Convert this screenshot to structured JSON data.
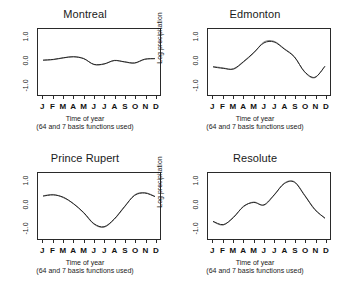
{
  "figure": {
    "axis": {
      "ylabel": "Log precipitation",
      "yticks": [
        "1.0",
        "0.0",
        "-1.0"
      ],
      "xticklabels": [
        "J",
        "F",
        "M",
        "A",
        "M",
        "J",
        "J",
        "A",
        "S",
        "O",
        "N",
        "D"
      ],
      "caption_main": "Time of year",
      "caption_sub": "(64 and 7 basis functions used)"
    },
    "panels": [
      {
        "title": "Montreal"
      },
      {
        "title": "Edmonton"
      },
      {
        "title": "Prince Rupert"
      },
      {
        "title": "Resolute"
      }
    ]
  },
  "chart_data": [
    {
      "type": "line",
      "title": "Montreal",
      "xlabel": "Time of year",
      "xlabel_sub": "(64 and 7 basis functions used)",
      "ylabel": "Log precipitation",
      "x": [
        "J",
        "F",
        "M",
        "A",
        "M",
        "J",
        "J",
        "A",
        "S",
        "O",
        "N",
        "D"
      ],
      "xlim": [
        0.5,
        12.5
      ],
      "ylim": [
        -1.45,
        1.35
      ],
      "yticks": [
        1.0,
        0.0,
        -1.0
      ],
      "grid": false,
      "legend": "none",
      "series": [
        {
          "name": "64 basis functions",
          "values": [
            0.02,
            0.05,
            0.12,
            0.18,
            0.1,
            -0.16,
            -0.14,
            0.02,
            -0.05,
            -0.1,
            0.06,
            0.1
          ]
        },
        {
          "name": "7 basis functions",
          "values": [
            0.03,
            0.06,
            0.13,
            0.17,
            0.09,
            -0.15,
            -0.13,
            0.01,
            -0.04,
            -0.09,
            0.07,
            0.09
          ]
        }
      ]
    },
    {
      "type": "line",
      "title": "Edmonton",
      "xlabel": "Time of year",
      "xlabel_sub": "(64 and 7 basis functions used)",
      "ylabel": "Log precipitation",
      "x": [
        "J",
        "F",
        "M",
        "A",
        "M",
        "J",
        "J",
        "A",
        "S",
        "O",
        "N",
        "D"
      ],
      "xlim": [
        0.5,
        12.5
      ],
      "ylim": [
        -1.45,
        1.35
      ],
      "yticks": [
        1.0,
        0.0,
        -1.0
      ],
      "grid": false,
      "legend": "none",
      "series": [
        {
          "name": "64 basis functions",
          "values": [
            -0.24,
            -0.3,
            -0.36,
            -0.05,
            0.33,
            0.8,
            0.83,
            0.52,
            0.18,
            -0.48,
            -0.72,
            -0.22
          ]
        },
        {
          "name": "7 basis functions",
          "values": [
            -0.26,
            -0.32,
            -0.34,
            -0.03,
            0.35,
            0.76,
            0.8,
            0.5,
            0.16,
            -0.46,
            -0.7,
            -0.24
          ]
        }
      ]
    },
    {
      "type": "line",
      "title": "Prince Rupert",
      "xlabel": "Time of year",
      "xlabel_sub": "(64 and 7 basis functions used)",
      "ylabel": "Log precipitation",
      "x": [
        "J",
        "F",
        "M",
        "A",
        "M",
        "J",
        "J",
        "A",
        "S",
        "O",
        "N",
        "D"
      ],
      "xlim": [
        0.5,
        12.5
      ],
      "ylim": [
        -1.45,
        1.35
      ],
      "yticks": [
        1.0,
        0.0,
        -1.0
      ],
      "grid": false,
      "legend": "none",
      "series": [
        {
          "name": "64 basis functions",
          "values": [
            0.38,
            0.44,
            0.3,
            0.05,
            -0.35,
            -0.82,
            -0.95,
            -0.62,
            -0.1,
            0.42,
            0.52,
            0.36
          ]
        },
        {
          "name": "7 basis functions",
          "values": [
            0.37,
            0.42,
            0.32,
            0.04,
            -0.33,
            -0.8,
            -0.93,
            -0.6,
            -0.08,
            0.4,
            0.5,
            0.35
          ]
        }
      ]
    },
    {
      "type": "line",
      "title": "Resolute",
      "xlabel": "Time of year",
      "xlabel_sub": "(64 and 7 basis functions used)",
      "ylabel": "Log precipitation",
      "x": [
        "J",
        "F",
        "M",
        "A",
        "M",
        "J",
        "J",
        "A",
        "S",
        "O",
        "N",
        "D"
      ],
      "xlim": [
        0.5,
        12.5
      ],
      "ylim": [
        -1.45,
        1.35
      ],
      "yticks": [
        1.0,
        0.0,
        -1.0
      ],
      "grid": false,
      "legend": "none",
      "series": [
        {
          "name": "64 basis functions",
          "values": [
            -0.72,
            -0.86,
            -0.52,
            -0.08,
            0.12,
            -0.02,
            0.4,
            0.92,
            0.98,
            0.42,
            -0.18,
            -0.58
          ]
        },
        {
          "name": "7 basis functions",
          "values": [
            -0.7,
            -0.84,
            -0.54,
            -0.06,
            0.1,
            0.0,
            0.42,
            0.9,
            0.96,
            0.4,
            -0.2,
            -0.56
          ]
        }
      ]
    }
  ]
}
